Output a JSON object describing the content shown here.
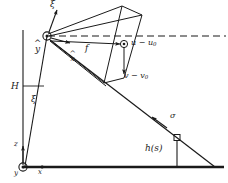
{
  "figure": {
    "background_color": "#ffffff",
    "stroke_color": "#1a1a1a",
    "labels": {
      "camera_axis_up": "ξ",
      "camera_axis_y_hat": "y",
      "camera_axis_x_hat": "x",
      "focal_length": "f",
      "image_u": "u − u",
      "image_u_sub": "0",
      "image_v": "v − v",
      "image_v_sub": "0",
      "camera_height": "H",
      "tilt_angle": "ξ",
      "world_axis_z": "z",
      "world_axis_x": "x",
      "world_axis_y": "y",
      "ray_direction": "σ",
      "terrain_height": "h(s)"
    }
  },
  "geometry": {
    "camera_center": {
      "x": 47,
      "y": 36
    },
    "world_origin": {
      "x": 23,
      "y": 167
    },
    "ground_line": {
      "x1": 23,
      "y1": 167,
      "x2": 224,
      "y2": 167
    },
    "vertical_post": {
      "x": 23,
      "y1": 30,
      "y2": 167
    },
    "optical_axis_dashed": {
      "x1": 47,
      "y1": 36,
      "x2": 226,
      "y2": 36
    },
    "principal_point": {
      "x": 124,
      "y": 44
    },
    "terrain_point": {
      "x": 177,
      "y": 138
    },
    "ray_ground_hit": {
      "x": 215,
      "y": 167
    },
    "sigma_arrow_tip": {
      "x": 152,
      "y": 117
    }
  }
}
